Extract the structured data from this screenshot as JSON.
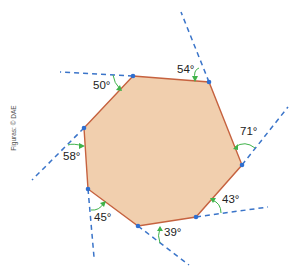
{
  "figure": {
    "credit": "Figuras: © DAE",
    "colors": {
      "polygon_fill": "#f1cfae",
      "polygon_stroke": "#c6623f",
      "extension_line": "#3a74c9",
      "vertex_dot": "#2f6fd0",
      "angle_arrow": "#3fb34a",
      "label_text": "#222222"
    },
    "shape": "heptagon",
    "vertices": [
      {
        "x": 133,
        "y": 76
      },
      {
        "x": 209,
        "y": 82
      },
      {
        "x": 242,
        "y": 165
      },
      {
        "x": 196,
        "y": 217
      },
      {
        "x": 138,
        "y": 226
      },
      {
        "x": 88,
        "y": 189
      },
      {
        "x": 84,
        "y": 128
      }
    ],
    "exterior_angles": [
      {
        "label": "50°",
        "value": 50
      },
      {
        "label": "54°",
        "value": 54
      },
      {
        "label": "71°",
        "value": 71
      },
      {
        "label": "43°",
        "value": 43
      },
      {
        "label": "39°",
        "value": 39
      },
      {
        "label": "45°",
        "value": 45
      },
      {
        "label": "58°",
        "value": 58
      }
    ],
    "angle_sum": 360
  }
}
